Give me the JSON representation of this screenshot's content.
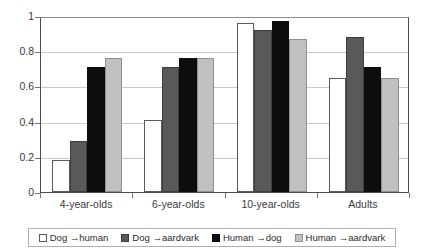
{
  "chart_data": {
    "type": "bar",
    "title": "",
    "subtitle": "",
    "xlabel": "",
    "ylabel": "",
    "categories": [
      "4-year-olds",
      "6-year-olds",
      "10-year-olds",
      "Adults"
    ],
    "series": [
      {
        "name": "Dog →human",
        "color": "#ffffff",
        "values": [
          0.18,
          0.41,
          0.96,
          0.65
        ]
      },
      {
        "name": "Dog →aardvark",
        "color": "#595959",
        "values": [
          0.29,
          0.71,
          0.92,
          0.88
        ]
      },
      {
        "name": "Human →dog",
        "color": "#0d0d0d",
        "values": [
          0.71,
          0.76,
          0.97,
          0.71
        ]
      },
      {
        "name": "Human →aardvark",
        "color": "#c0c0c0",
        "values": [
          0.76,
          0.76,
          0.87,
          0.65
        ]
      }
    ],
    "ylim": [
      0,
      1
    ],
    "yticks": [
      0,
      0.2,
      0.4,
      0.6,
      0.8,
      1
    ],
    "ytick_labels": [
      "0",
      "0.2",
      "0.4",
      "0.6",
      "0.8",
      "1"
    ],
    "grid": true,
    "grid_axis": "y",
    "legend_position": "bottom",
    "legend_border_color": "#b0b0b0",
    "axis_color": "#4d4d4d",
    "gridline_color": "#c8c8c8",
    "background": "#ffffff"
  }
}
